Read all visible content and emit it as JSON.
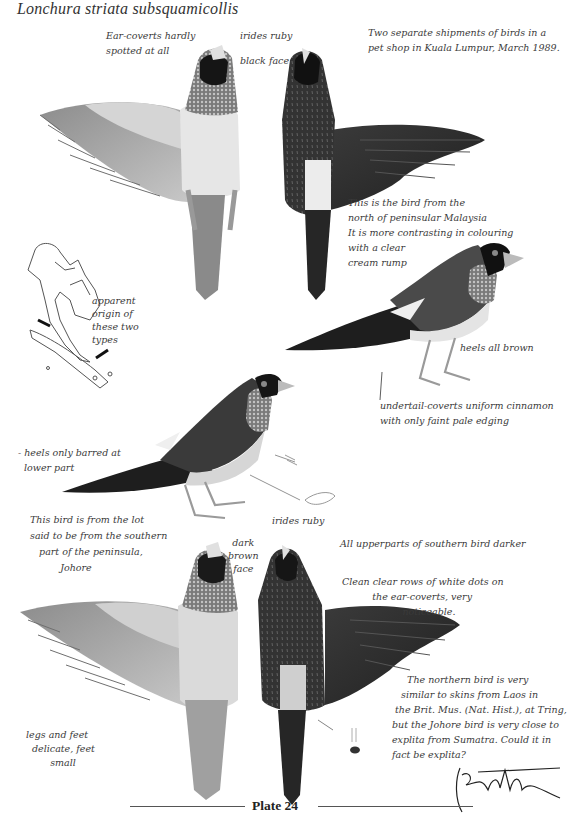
{
  "title": "Lonchura striata subsquamicollis",
  "plate_label": "Plate 24",
  "annotations": {
    "ear_coverts": "Ear-coverts hardly\nspotted at all",
    "irides_top": "irides ruby",
    "black_face": "black face",
    "shipments": "Two separate shipments of birds in a\npet shop in Kuala Lumpur, March 1989.",
    "north_bird": "This is the bird from the\nnorth of peninsular Malaysia\nIt is more contrasting in colouring\nwith a clear\ncream rump",
    "map_label": "apparent\norigin of\nthese two\ntypes",
    "heels_brown": "heels all brown",
    "undertail": "undertail-coverts uniform cinnamon\nwith only faint pale edging",
    "heels_barred": "- heels only barred at\n  lower part",
    "south_bird": "This bird is from the lot\nsaid to be from the southern\n   part of the peninsula,\n          Johore",
    "irides_mid": "irides ruby",
    "dark_brown_face": "dark\nbrown\nface",
    "upperparts": "All upperparts of southern bird darker",
    "white_dots": "Clean clear rows of white dots on\n          the ear-coverts, very\n                    noticeable.",
    "legs_feet": "legs and feet\n  delicate, feet\n        small",
    "northern_similar": "     The northern bird is very\n   similar to skins from Laos in\n the Brit. Mus. (Nat. Hist.), at Tring,\nbut the Johore bird is very close to\nexplita from Sumatra. Could it in\nfact be explita?",
    "signature": "signature"
  },
  "figures": [
    {
      "id": "north-ventral",
      "label": "Northern bird, ventral view, wing spread"
    },
    {
      "id": "north-dorsal",
      "label": "Northern bird, dorsal view, wing spread"
    },
    {
      "id": "north-side",
      "label": "Northern bird, side view"
    },
    {
      "id": "south-side",
      "label": "Southern bird, side view"
    },
    {
      "id": "south-ventral",
      "label": "Southern bird, ventral view, wing spread"
    },
    {
      "id": "south-dorsal",
      "label": "Southern bird, dorsal view, wing spread"
    },
    {
      "id": "map",
      "label": "Map of mainland Southeast Asia and Sumatra"
    }
  ],
  "colors": {
    "ink": "#3a3a3a",
    "dark_plumage": "#2e2e2e",
    "mid_plumage": "#7a7a7a",
    "pale_plumage": "#d8d8d8"
  }
}
